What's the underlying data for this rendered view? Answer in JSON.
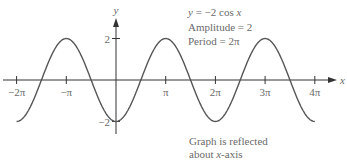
{
  "chart_data": {
    "type": "line",
    "title": "",
    "function": "y = -2 cos x",
    "xlabel": "x",
    "ylabel": "y",
    "xlim": [
      -6.2832,
      12.5664
    ],
    "ylim": [
      -2,
      2
    ],
    "grid": false,
    "x_ticks": [
      {
        "value": -6.2832,
        "label": "−2π"
      },
      {
        "value": -3.1416,
        "label": "−π"
      },
      {
        "value": 3.1416,
        "label": "π"
      },
      {
        "value": 6.2832,
        "label": "2π"
      },
      {
        "value": 9.4248,
        "label": "3π"
      },
      {
        "value": 12.5664,
        "label": "4π"
      }
    ],
    "y_ticks": [
      {
        "value": 2,
        "label": "2"
      },
      {
        "value": -2,
        "label": "−2"
      }
    ],
    "series": [
      {
        "name": "y = -2 cos x",
        "x": [
          -6.2832,
          -4.7124,
          -3.1416,
          -1.5708,
          0,
          1.5708,
          3.1416,
          4.7124,
          6.2832,
          7.854,
          9.4248,
          10.9956,
          12.5664
        ],
        "values": [
          -2,
          0,
          2,
          0,
          -2,
          0,
          2,
          0,
          -2,
          0,
          2,
          0,
          -2
        ]
      }
    ],
    "annotations": [
      "y = −2 cos x",
      "Amplitude = 2",
      "Period = 2π",
      "Graph is reflected about x-axis"
    ],
    "colors": {
      "curve": "#555555",
      "axis": "#333333",
      "text": "#6a6a6a"
    }
  },
  "info": {
    "equation_lhs": "y",
    "equation_mid": " = −2 cos ",
    "equation_var": "x",
    "amplitude": "Amplitude = 2",
    "period": "Period = 2π"
  },
  "note": {
    "line1": "Graph is reflected",
    "line2_prefix": "about ",
    "line2_var": "x",
    "line2_suffix": "-axis"
  }
}
